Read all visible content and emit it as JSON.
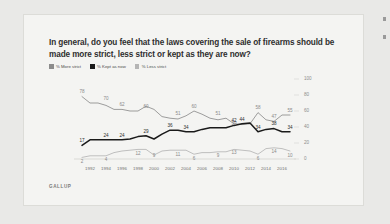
{
  "card": {
    "title": "In general, do you feel that the laws covering the sale of firearms should be made more strict, less strict or kept as they are now?",
    "source": "GALLUP"
  },
  "legend": {
    "position": "top-left",
    "items": [
      {
        "label": "% More strict",
        "color": "#8c8c8c"
      },
      {
        "label": "% Kept as now",
        "color": "#1a1a1a"
      },
      {
        "label": "% Less strict",
        "color": "#b5b5b5"
      }
    ]
  },
  "axes": {
    "y_ticks": [
      "0",
      "20",
      "40",
      "60",
      "80",
      "100"
    ],
    "x_ticks": [
      "1992",
      "1994",
      "1996",
      "1998",
      "2000",
      "2002",
      "2004",
      "2006",
      "2008",
      "2010",
      "2012",
      "2014",
      "2016"
    ]
  },
  "chart_data": {
    "type": "line",
    "title": "In general, do you feel that the laws covering the sale of firearms should be made more strict, less strict or kept as they are now?",
    "xlabel": "",
    "ylabel": "",
    "ylim": [
      0,
      100
    ],
    "grid": false,
    "legend_position": "top-left",
    "x": [
      1991,
      1992,
      1993,
      1994,
      1995,
      1996,
      1997,
      1998,
      1999,
      2000,
      2001,
      2002,
      2003,
      2004,
      2005,
      2006,
      2007,
      2008,
      2009,
      2010,
      2011,
      2012,
      2013,
      2014,
      2015,
      2016,
      2017
    ],
    "series": [
      {
        "name": "% More strict",
        "color": "#8c8c8c",
        "values": [
          78,
          70,
          70,
          67,
          62,
          62,
          60,
          60,
          66,
          62,
          53,
          51,
          50,
          54,
          60,
          56,
          51,
          49,
          51,
          44,
          43,
          44,
          58,
          49,
          47,
          55,
          55
        ],
        "labels": [
          {
            "x": 1991,
            "value": 78
          },
          {
            "x": 1994,
            "value": 70
          },
          {
            "x": 1996,
            "value": 62
          },
          {
            "x": 1999,
            "value": 60
          },
          {
            "x": 2003,
            "value": 51
          },
          {
            "x": 2005,
            "value": 60
          },
          {
            "x": 2008,
            "value": 51
          },
          {
            "x": 2010,
            "value": 39
          },
          {
            "x": 2013,
            "value": 58
          },
          {
            "x": 2015,
            "value": 47
          },
          {
            "x": 2017,
            "value": 55
          }
        ]
      },
      {
        "name": "% Kept as now",
        "color": "#1a1a1a",
        "values": [
          17,
          24,
          24,
          24,
          24,
          24,
          25,
          28,
          29,
          25,
          31,
          36,
          36,
          34,
          34,
          37,
          39,
          39,
          39,
          42,
          44,
          45,
          34,
          37,
          38,
          34,
          34
        ],
        "labels": [
          {
            "x": 1991,
            "value": 17
          },
          {
            "x": 1994,
            "value": 24
          },
          {
            "x": 1996,
            "value": 24
          },
          {
            "x": 1999,
            "value": 29
          },
          {
            "x": 2002,
            "value": 36
          },
          {
            "x": 2004,
            "value": 34
          },
          {
            "x": 2010,
            "value": 42
          },
          {
            "x": 2011,
            "value": 44
          },
          {
            "x": 2013,
            "value": 34
          },
          {
            "x": 2015,
            "value": 38
          },
          {
            "x": 2017,
            "value": 34
          }
        ]
      },
      {
        "name": "% Less strict",
        "color": "#b5b5b5",
        "values": [
          2,
          4,
          4,
          4,
          8,
          10,
          11,
          12,
          12,
          5,
          10,
          11,
          11,
          11,
          6,
          8,
          8,
          9,
          9,
          12,
          11,
          10,
          6,
          13,
          14,
          13,
          10
        ],
        "labels": [
          {
            "x": 1991,
            "value": 2
          },
          {
            "x": 1994,
            "value": 4
          },
          {
            "x": 1998,
            "value": 12
          },
          {
            "x": 2000,
            "value": 9
          },
          {
            "x": 2003,
            "value": 11
          },
          {
            "x": 2005,
            "value": 6
          },
          {
            "x": 2008,
            "value": 9
          },
          {
            "x": 2010,
            "value": 13
          },
          {
            "x": 2013,
            "value": 6
          },
          {
            "x": 2015,
            "value": 14
          },
          {
            "x": 2017,
            "value": 10
          }
        ]
      }
    ]
  }
}
